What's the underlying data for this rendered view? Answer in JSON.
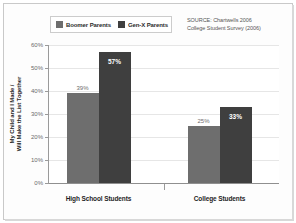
{
  "chart_data": {
    "type": "bar",
    "title": "",
    "subtitle": "",
    "xlabel": "",
    "ylabel": "My Child and I Made / Will Make the List Together",
    "ylabel_lines": [
      "My Child and I Made /",
      "Will Make the List Together"
    ],
    "categories": [
      "High School Students",
      "College Students"
    ],
    "series": [
      {
        "name": "Boomer Parents",
        "color": "#6e6e6e",
        "values": [
          39,
          25
        ],
        "value_labels": [
          "39%",
          "25%"
        ],
        "label_position": "outside"
      },
      {
        "name": "Gen-X Parents",
        "color": "#3f3f3f",
        "values": [
          57,
          33
        ],
        "value_labels": [
          "57%",
          "33%"
        ],
        "label_position": "inside"
      }
    ],
    "ylim": [
      0,
      60
    ],
    "ytick_values": [
      0,
      10,
      20,
      30,
      40,
      50,
      60
    ],
    "ytick_labels": [
      "0%",
      "10%",
      "20%",
      "30%",
      "40%",
      "50%",
      "60%"
    ],
    "grid": true,
    "grid_axis": "y",
    "legend_position": "top-left",
    "annotations": {
      "source_lines": [
        "SOURCE: Chartwells 2006",
        "College Student Survey (2006)"
      ]
    }
  },
  "colors": {
    "boomer": "#6e6e6e",
    "genx": "#3f3f3f",
    "gridline": "#e6e6e6",
    "axis": "#9a9a9a",
    "frame": "#c9c9c9",
    "label_text": "#6d6d6d",
    "inside_label_text": "#ffffff"
  }
}
